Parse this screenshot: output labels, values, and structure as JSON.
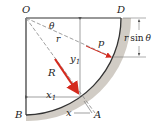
{
  "diagram": {
    "type": "quarter-circle gate / hydrostatic force diagram",
    "labels": {
      "O": "O",
      "D": "D",
      "B": "B",
      "A": "A",
      "theta": "θ",
      "r": "r",
      "p": "p",
      "R": "R",
      "y1": "y",
      "y1_sub": "1",
      "x1": "x",
      "x1_sub": "1",
      "x": "x",
      "rsin_r": "r",
      "rsin_text": "sin",
      "rsin_theta": "θ"
    },
    "colors": {
      "line": "#333333",
      "dashed": "#888888",
      "arrow_red": "#d42a1e",
      "shadow": "#b8b2aa",
      "dimension": "#555555"
    }
  }
}
